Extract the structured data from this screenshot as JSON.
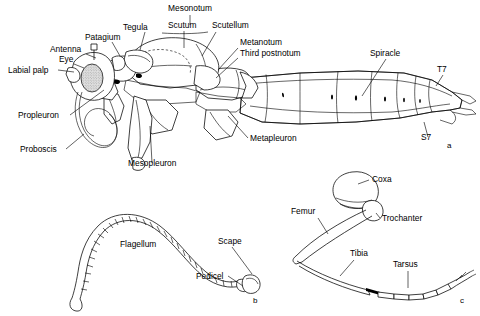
{
  "figure": {
    "kind": "scientific-illustration",
    "background_color": "#ffffff",
    "ink_color": "#000000",
    "panels": [
      {
        "id": "a",
        "letter": "a",
        "caption_x": 447,
        "caption_y": 148,
        "subject": "lateral habitus of thorax and abdomen"
      },
      {
        "id": "b",
        "letter": "b",
        "caption_x": 253,
        "caption_y": 303,
        "subject": "antenna"
      },
      {
        "id": "c",
        "letter": "c",
        "caption_x": 460,
        "caption_y": 303,
        "subject": "leg"
      }
    ],
    "panel_a_labels": [
      {
        "id": "mesonotum",
        "text": "Mesonotum",
        "x": 190,
        "y": 11,
        "anchor": "middle"
      },
      {
        "id": "tegula",
        "text": "Tegula",
        "x": 123,
        "y": 30,
        "anchor": "start"
      },
      {
        "id": "scutum",
        "text": "Scutum",
        "x": 168,
        "y": 28,
        "anchor": "start"
      },
      {
        "id": "scutellum",
        "text": "Scutellum",
        "x": 212,
        "y": 28,
        "anchor": "start"
      },
      {
        "id": "patagium",
        "text": "Patagium",
        "x": 85,
        "y": 40,
        "anchor": "start"
      },
      {
        "id": "metanotum",
        "text": "Metanotum",
        "x": 240,
        "y": 45,
        "anchor": "start"
      },
      {
        "id": "third-postnotum",
        "text": "Third postnotum",
        "x": 240,
        "y": 56,
        "anchor": "start"
      },
      {
        "id": "antenna",
        "text": "Antenna",
        "x": 50,
        "y": 52,
        "anchor": "start"
      },
      {
        "id": "eye",
        "text": "Eye",
        "x": 59,
        "y": 62,
        "anchor": "start"
      },
      {
        "id": "labial-palp",
        "text": "Labial palp",
        "x": 8,
        "y": 73,
        "anchor": "start"
      },
      {
        "id": "spiracle",
        "text": "Spiracle",
        "x": 370,
        "y": 56,
        "anchor": "start"
      },
      {
        "id": "t7",
        "text": "T7",
        "x": 437,
        "y": 72,
        "anchor": "start"
      },
      {
        "id": "s7",
        "text": "S7",
        "x": 421,
        "y": 140,
        "anchor": "start"
      },
      {
        "id": "propleuron",
        "text": "Propleuron",
        "x": 18,
        "y": 118,
        "anchor": "start"
      },
      {
        "id": "proboscis",
        "text": "Proboscis",
        "x": 20,
        "y": 152,
        "anchor": "start"
      },
      {
        "id": "mesopleuron",
        "text": "Mesopleuron",
        "x": 128,
        "y": 166,
        "anchor": "start"
      },
      {
        "id": "metapleuron",
        "text": "Metapleuron",
        "x": 250,
        "y": 141,
        "anchor": "start"
      }
    ],
    "panel_b_labels": [
      {
        "id": "flagellum",
        "text": "Flagellum",
        "x": 120,
        "y": 247,
        "anchor": "start"
      },
      {
        "id": "scape",
        "text": "Scape",
        "x": 218,
        "y": 244,
        "anchor": "start"
      },
      {
        "id": "pedicel",
        "text": "Pedicel",
        "x": 196,
        "y": 279,
        "anchor": "start"
      }
    ],
    "panel_c_labels": [
      {
        "id": "coxa",
        "text": "Coxa",
        "x": 372,
        "y": 182,
        "anchor": "start"
      },
      {
        "id": "femur",
        "text": "Femur",
        "x": 291,
        "y": 214,
        "anchor": "start"
      },
      {
        "id": "trochanter",
        "text": "Trochanter",
        "x": 382,
        "y": 221,
        "anchor": "start"
      },
      {
        "id": "tibia",
        "text": "Tibia",
        "x": 350,
        "y": 256,
        "anchor": "start"
      },
      {
        "id": "tarsus",
        "text": "Tarsus",
        "x": 393,
        "y": 267,
        "anchor": "start"
      }
    ]
  }
}
